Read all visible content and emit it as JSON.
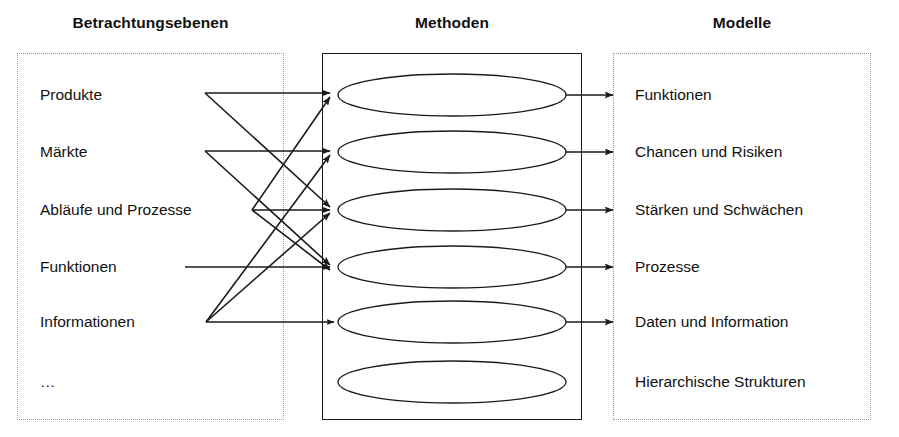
{
  "columns": {
    "left": {
      "title": "Betrachtungsebenen"
    },
    "middle": {
      "title": "Methoden"
    },
    "right": {
      "title": "Modelle"
    }
  },
  "left_items": [
    {
      "label": "Produkte"
    },
    {
      "label": "Märkte"
    },
    {
      "label": "Abläufe und Prozesse"
    },
    {
      "label": "Funktionen"
    },
    {
      "label": "Informationen"
    },
    {
      "label": "…"
    }
  ],
  "method_nodes": [
    {
      "label": ""
    },
    {
      "label": ""
    },
    {
      "label": ""
    },
    {
      "label": ""
    },
    {
      "label": ""
    },
    {
      "label": ""
    }
  ],
  "right_items": [
    {
      "label": "Funktionen"
    },
    {
      "label": "Chancen und Risiken"
    },
    {
      "label": "Stärken und Schwächen"
    },
    {
      "label": "Prozesse"
    },
    {
      "label": "Daten und Information"
    },
    {
      "label": "Hierarchische Strukturen"
    }
  ],
  "connections": {
    "left_to_method": [
      {
        "from": "Produkte",
        "to": 1
      },
      {
        "from": "Produkte",
        "to": 3
      },
      {
        "from": "Märkte",
        "to": 2
      },
      {
        "from": "Märkte",
        "to": 4
      },
      {
        "from": "Abläufe und Prozesse",
        "to": 1
      },
      {
        "from": "Abläufe und Prozesse",
        "to": 3
      },
      {
        "from": "Abläufe und Prozesse",
        "to": 4
      },
      {
        "from": "Informationen",
        "to": 2
      },
      {
        "from": "Informationen",
        "to": 3
      },
      {
        "from": "Informationen",
        "to": 5
      },
      {
        "from": "Funktionen",
        "to": 4
      }
    ],
    "method_to_right": [
      {
        "from": 1,
        "to": "Funktionen"
      },
      {
        "from": 2,
        "to": "Chancen und Risiken"
      },
      {
        "from": 3,
        "to": "Stärken und Schwächen"
      },
      {
        "from": 4,
        "to": "Prozesse"
      },
      {
        "from": 5,
        "to": "Daten und Information"
      }
    ]
  },
  "colors": {
    "stroke": "#1a1a1a",
    "dotted_border": "#9a9a9a",
    "text": "#111111",
    "background": "#ffffff"
  }
}
